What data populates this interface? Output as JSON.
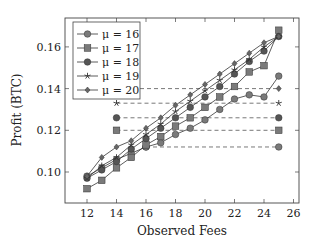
{
  "chart_data": {
    "type": "line",
    "title": "",
    "xlabel": "Observed Fees",
    "ylabel": "Profit (BTC)",
    "xlim": [
      10.5,
      26.4
    ],
    "ylim": [
      0.085,
      0.172
    ],
    "xticks": [
      12,
      14,
      16,
      18,
      20,
      22,
      24,
      26
    ],
    "xtick_labels": [
      "12",
      "14",
      "16",
      "18",
      "20",
      "22",
      "24",
      "26"
    ],
    "yticks": [
      0.1,
      0.12,
      0.14,
      0.16
    ],
    "ytick_labels": [
      "0.10",
      "0.12",
      "0.14",
      "0.16"
    ],
    "grid": false,
    "legend_position": "upper left",
    "x": [
      12,
      13,
      14,
      15,
      16,
      17,
      18,
      19,
      20,
      21,
      22,
      23,
      24,
      25
    ],
    "series": [
      {
        "name": "μ = 16",
        "marker": "circle",
        "color": "#7a7a7a",
        "values": [
          0.098,
          0.102,
          0.106,
          0.109,
          0.112,
          0.114,
          0.118,
          0.121,
          0.125,
          0.13,
          0.135,
          0.137,
          0.136,
          0.146
        ]
      },
      {
        "name": "μ = 17",
        "marker": "square",
        "color": "#7a7a7a",
        "values": [
          0.092,
          0.096,
          0.102,
          0.107,
          0.113,
          0.117,
          0.122,
          0.126,
          0.131,
          0.136,
          0.141,
          0.148,
          0.151,
          0.168
        ]
      },
      {
        "name": "μ = 18",
        "marker": "circle",
        "color": "#555555",
        "values": [
          0.097,
          0.101,
          0.105,
          0.111,
          0.116,
          0.121,
          0.126,
          0.131,
          0.136,
          0.141,
          0.147,
          0.153,
          0.158,
          0.165
        ]
      },
      {
        "name": "μ = 19",
        "marker": "star",
        "color": "#555555",
        "values": [
          0.097,
          0.103,
          0.107,
          0.113,
          0.118,
          0.123,
          0.129,
          0.134,
          0.139,
          0.144,
          0.149,
          0.154,
          0.16,
          0.165
        ]
      },
      {
        "name": "μ = 20",
        "marker": "diamond",
        "color": "#666666",
        "values": [
          0.098,
          0.107,
          0.112,
          0.115,
          0.121,
          0.126,
          0.132,
          0.137,
          0.142,
          0.147,
          0.152,
          0.157,
          0.162,
          0.165
        ]
      }
    ],
    "reference_lines": [
      {
        "series": "μ = 20",
        "marker": "diamond",
        "y": 0.14,
        "x_start": 14.0,
        "x_end": 25
      },
      {
        "series": "μ = 19",
        "marker": "star",
        "y": 0.133,
        "x_start": 14,
        "x_end": 25
      },
      {
        "series": "μ = 18",
        "marker": "circle",
        "y": 0.126,
        "x_start": 14,
        "x_end": 25
      },
      {
        "series": "μ = 17",
        "marker": "square",
        "y": 0.12,
        "x_start": 14,
        "x_end": 25
      },
      {
        "series": "μ = 16",
        "marker": "circle",
        "y": 0.112,
        "x_start": 16,
        "x_end": 25
      }
    ]
  },
  "legend": {
    "items": [
      {
        "label": "μ = 16",
        "marker": "circle"
      },
      {
        "label": "μ = 17",
        "marker": "square"
      },
      {
        "label": "μ = 18",
        "marker": "circle"
      },
      {
        "label": "μ = 19",
        "marker": "star"
      },
      {
        "label": "μ = 20",
        "marker": "diamond"
      }
    ]
  },
  "axes": {
    "xlabel": "Observed Fees",
    "ylabel": "Profit (BTC)"
  }
}
